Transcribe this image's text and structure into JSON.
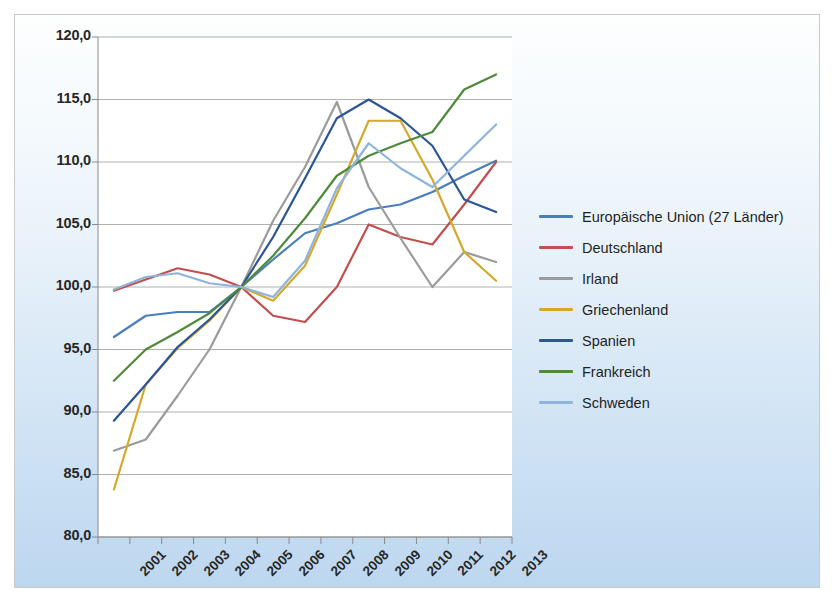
{
  "chart_data": {
    "type": "line",
    "title": "",
    "subtitle": "",
    "xlabel": "",
    "ylabel": "",
    "categories": [
      "2001",
      "2002",
      "2003",
      "2004",
      "2005",
      "2006",
      "2007",
      "2008",
      "2009",
      "2010",
      "2011",
      "2012",
      "2013"
    ],
    "ylim": [
      80.0,
      120.0
    ],
    "ytick_values": [
      80.0,
      85.0,
      90.0,
      95.0,
      100.0,
      105.0,
      110.0,
      115.0,
      120.0
    ],
    "ytick_labels": [
      "80,0",
      "85,0",
      "90,0",
      "95,0",
      "100,0",
      "105,0",
      "110,0",
      "115,0",
      "120,0"
    ],
    "grid": true,
    "legend_position": "right",
    "series": [
      {
        "name": "Europäische Union (27 Länder)",
        "color": "#4A7EBB",
        "values": [
          96.0,
          97.7,
          98.0,
          98.0,
          100.0,
          102.2,
          104.3,
          105.1,
          106.2,
          106.6,
          107.6,
          108.9,
          110.1
        ]
      },
      {
        "name": "Deutschland",
        "color": "#C0504D",
        "values": [
          99.7,
          100.6,
          101.5,
          101.0,
          100.0,
          97.7,
          97.2,
          100.0,
          105.0,
          104.0,
          103.4,
          106.6,
          110.0
        ]
      },
      {
        "name": "Irland",
        "color": "#9B9B9B",
        "values": [
          86.9,
          87.8,
          91.3,
          95.0,
          100.0,
          105.3,
          109.6,
          114.8,
          108.0,
          103.9,
          100.0,
          102.8,
          102.0
        ]
      },
      {
        "name": "Griechenland",
        "color": "#D4A92B",
        "values": [
          83.8,
          92.2,
          95.1,
          97.3,
          100.0,
          98.9,
          101.7,
          107.4,
          113.3,
          113.3,
          108.6,
          102.8,
          100.5
        ]
      },
      {
        "name": "Spanien",
        "color": "#2B5597",
        "values": [
          89.3,
          92.2,
          95.2,
          97.4,
          100.0,
          104.0,
          108.7,
          113.5,
          115.0,
          113.5,
          111.3,
          107.0,
          106.0
        ]
      },
      {
        "name": "Frankreich",
        "color": "#4F8A3B",
        "values": [
          92.5,
          95.0,
          96.4,
          97.9,
          100.0,
          102.5,
          105.5,
          108.9,
          110.5,
          111.5,
          112.4,
          115.8,
          117.0
        ]
      },
      {
        "name": "Schweden",
        "color": "#8FB4DC",
        "values": [
          99.8,
          100.8,
          101.1,
          100.3,
          100.0,
          99.2,
          102.1,
          107.9,
          111.5,
          109.5,
          108.0,
          110.5,
          113.0
        ]
      }
    ]
  }
}
